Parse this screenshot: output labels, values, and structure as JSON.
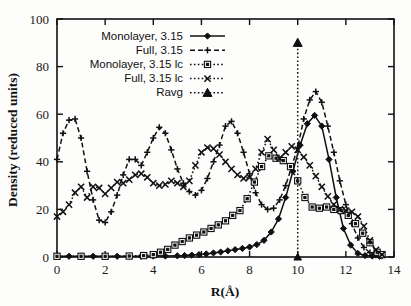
{
  "figure": {
    "background_color": "#fdfdfc",
    "ink_color": "#101010"
  },
  "axes": {
    "x_title": "R(Å)",
    "y_title": "Density (reduced units)",
    "x_ticks": [
      "0",
      "2",
      "4",
      "6",
      "8",
      "10",
      "12",
      "14"
    ],
    "y_ticks": [
      "0",
      "20",
      "40",
      "60",
      "80",
      "100"
    ]
  },
  "legend": {
    "position": "top-left-inside",
    "items": [
      {
        "label": "Monolayer, 3.15",
        "marker": "filled-diamond",
        "line": "solid"
      },
      {
        "label": "Full, 3.15",
        "marker": "plus",
        "line": "dashed"
      },
      {
        "label": "Monolayer, 3.15 lc",
        "marker": "open-square",
        "line": "dotted"
      },
      {
        "label": "Full, 3.15 lc",
        "marker": "cross",
        "line": "dotted"
      },
      {
        "label": "Ravg",
        "marker": "filled-triangle",
        "line": "dotted"
      }
    ]
  },
  "chart_data": {
    "type": "line",
    "title": "",
    "xlabel": "R(Å)",
    "ylabel": "Density (reduced units)",
    "xlim": [
      0,
      14
    ],
    "ylim": [
      0,
      100
    ],
    "xticks": [
      0,
      2,
      4,
      6,
      8,
      10,
      12,
      14
    ],
    "yticks": [
      0,
      20,
      40,
      60,
      80,
      100
    ],
    "grid": false,
    "legend_position": "upper left",
    "annotations": [
      {
        "text": "Ravg",
        "type": "vertical-line",
        "x": 10,
        "y_top": 90
      }
    ],
    "series": [
      {
        "name": "Monolayer, 3.15",
        "marker": "filled-diamond",
        "linestyle": "solid",
        "x": [
          0.0,
          0.5,
          1.0,
          1.5,
          2.0,
          2.5,
          3.0,
          3.5,
          4.0,
          4.5,
          5.0,
          5.3,
          5.6,
          5.9,
          6.2,
          6.5,
          6.8,
          7.1,
          7.4,
          7.7,
          8.0,
          8.3,
          8.6,
          8.9,
          9.2,
          9.5,
          9.8,
          10.1,
          10.4,
          10.7,
          11.0,
          11.3,
          11.6,
          11.9,
          12.2,
          12.5,
          12.8,
          13.1,
          13.4
        ],
        "y": [
          0.3,
          0.3,
          0.3,
          0.3,
          0.3,
          0.3,
          0.3,
          0.3,
          0.4,
          0.4,
          0.5,
          0.6,
          0.8,
          1.0,
          1.3,
          1.7,
          2.1,
          2.6,
          3.1,
          3.6,
          4.2,
          5.2,
          7.0,
          10.5,
          16.0,
          25.0,
          36.0,
          47.0,
          56.0,
          59.5,
          55.0,
          41.0,
          25.0,
          12.0,
          5.0,
          1.5,
          0.6,
          0.4,
          0.3
        ]
      },
      {
        "name": "Full, 3.15",
        "marker": "plus",
        "linestyle": "dashed",
        "x": [
          0.0,
          0.25,
          0.5,
          0.75,
          1.0,
          1.25,
          1.5,
          1.75,
          2.0,
          2.25,
          2.5,
          2.75,
          3.0,
          3.25,
          3.5,
          3.75,
          4.0,
          4.25,
          4.5,
          4.75,
          5.0,
          5.25,
          5.5,
          5.75,
          6.0,
          6.25,
          6.5,
          6.75,
          7.0,
          7.25,
          7.5,
          7.75,
          8.0,
          8.25,
          8.5,
          8.75,
          9.0,
          9.25,
          9.5,
          9.75,
          10.0,
          10.25,
          10.5,
          10.75,
          11.0,
          11.25,
          11.5,
          11.75,
          12.0,
          12.25,
          12.5,
          12.75,
          13.0,
          13.25,
          13.5
        ],
        "y": [
          41.0,
          52.0,
          57.5,
          58.0,
          50.0,
          36.0,
          24.0,
          15.5,
          14.5,
          19.0,
          26.0,
          34.5,
          41.0,
          41.0,
          38.5,
          44.0,
          50.0,
          54.5,
          52.0,
          45.0,
          37.0,
          31.0,
          27.5,
          26.0,
          28.0,
          33.0,
          40.0,
          47.0,
          55.0,
          57.0,
          52.0,
          44.0,
          35.0,
          27.0,
          22.0,
          20.0,
          20.5,
          24.0,
          30.0,
          38.0,
          46.0,
          58.0,
          66.0,
          69.5,
          65.0,
          55.0,
          44.0,
          32.0,
          22.0,
          14.0,
          8.0,
          4.0,
          1.8,
          0.8,
          0.4
        ]
      },
      {
        "name": "Monolayer, 3.15 lc",
        "marker": "open-square",
        "linestyle": "dotted",
        "x": [
          0.0,
          1.0,
          2.0,
          3.0,
          3.6,
          4.0,
          4.3,
          4.6,
          4.9,
          5.2,
          5.5,
          5.8,
          6.1,
          6.4,
          6.7,
          7.0,
          7.3,
          7.6,
          7.9,
          8.2,
          8.5,
          8.8,
          9.1,
          9.4,
          9.7,
          10.0,
          10.3,
          10.6,
          10.9,
          11.2,
          11.5,
          11.8,
          12.1,
          12.4,
          12.7,
          13.0,
          13.3,
          13.5
        ],
        "y": [
          0.3,
          0.3,
          0.3,
          0.4,
          0.6,
          1.0,
          2.0,
          3.2,
          5.0,
          6.5,
          8.0,
          9.2,
          10.5,
          12.0,
          13.5,
          15.2,
          17.5,
          19.5,
          24.5,
          31.5,
          38.0,
          42.5,
          41.5,
          40.5,
          38.0,
          32.0,
          25.0,
          21.0,
          20.5,
          21.0,
          20.0,
          19.5,
          17.5,
          14.0,
          10.0,
          6.0,
          2.0,
          1.0
        ]
      },
      {
        "name": "Full, 3.15 lc",
        "marker": "cross",
        "linestyle": "dotted",
        "x": [
          0.0,
          0.25,
          0.5,
          0.75,
          1.0,
          1.25,
          1.5,
          1.75,
          2.0,
          2.25,
          2.5,
          2.75,
          3.0,
          3.25,
          3.5,
          3.75,
          4.0,
          4.25,
          4.5,
          4.75,
          5.0,
          5.25,
          5.5,
          5.75,
          6.0,
          6.25,
          6.5,
          6.75,
          7.0,
          7.25,
          7.5,
          7.75,
          8.0,
          8.25,
          8.5,
          8.75,
          9.0,
          9.25,
          9.5,
          9.75,
          10.0,
          10.25,
          10.5,
          10.75,
          11.0,
          11.25,
          11.5,
          11.75,
          12.0,
          12.25,
          12.5,
          12.75,
          13.0,
          13.25,
          13.5
        ],
        "y": [
          17.0,
          19.0,
          22.0,
          27.0,
          29.5,
          25.0,
          29.5,
          29.0,
          26.5,
          29.0,
          31.5,
          31.0,
          32.5,
          34.5,
          35.0,
          33.5,
          31.0,
          30.0,
          30.5,
          32.0,
          31.0,
          29.5,
          32.0,
          38.5,
          44.0,
          46.0,
          45.5,
          43.0,
          40.0,
          37.0,
          34.5,
          33.0,
          33.5,
          37.0,
          44.0,
          49.5,
          45.0,
          41.5,
          44.0,
          46.5,
          45.0,
          42.0,
          38.5,
          34.0,
          29.5,
          25.5,
          22.0,
          20.0,
          19.5,
          19.0,
          17.0,
          13.0,
          7.0,
          3.0,
          1.0
        ]
      },
      {
        "name": "Ravg",
        "marker": "filled-triangle",
        "linestyle": "dotted",
        "x": [
          10.0,
          10.0
        ],
        "y": [
          0.0,
          90.0
        ]
      }
    ]
  }
}
